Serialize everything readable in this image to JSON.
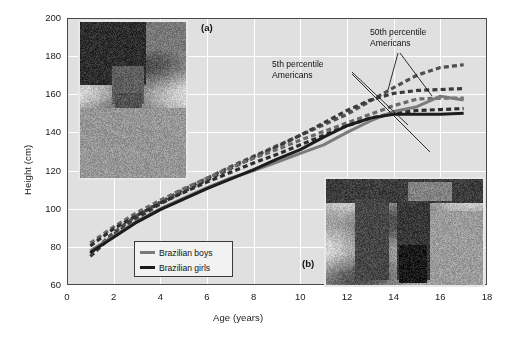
{
  "figure": {
    "panel_a_label": "(a)",
    "panel_b_label": "(b)"
  },
  "annotations": {
    "p5_line1": "5th percentile",
    "p5_line2": "Americans",
    "p50_line1": "50th percentile",
    "p50_line2": "Americans"
  },
  "legend": {
    "boys_label": "Brazilian boys",
    "girls_label": "Brazilian girls",
    "boys_color": "#7b7b7b",
    "girls_color": "#1c1c1c"
  },
  "photos": {
    "photo_a_name": "malnourished-child-photo",
    "photo_b_name": "girls-carrying-basin-photo"
  },
  "chart_data": {
    "type": "line",
    "title": "",
    "xlabel": "Age (years)",
    "ylabel": "Height (cm)",
    "xlim": [
      0,
      18
    ],
    "ylim": [
      60,
      200
    ],
    "xticks": [
      0,
      2,
      4,
      6,
      8,
      10,
      12,
      14,
      16,
      18
    ],
    "yticks": [
      60,
      80,
      100,
      120,
      140,
      160,
      180,
      200
    ],
    "grid": true,
    "legend_position": "lower-left-inside",
    "plot_bgcolor": "#e0e0e0",
    "grid_color": "#ffffff",
    "axis_color": "#4a4a4a",
    "x": [
      1,
      2,
      3,
      4,
      5,
      6,
      7,
      8,
      9,
      10,
      11,
      12,
      13,
      14,
      15,
      16,
      17
    ],
    "series": [
      {
        "name": "50th percentile Americans boys",
        "style": "dashed",
        "color": "#4f4f4f",
        "width": 3.2,
        "values": [
          76.5,
          87.5,
          96.5,
          103.5,
          110.0,
          116.0,
          122.0,
          127.5,
          133.0,
          138.5,
          144.0,
          149.5,
          156.5,
          163.5,
          170.0,
          174.0,
          175.5
        ]
      },
      {
        "name": "50th percentile Americans girls",
        "style": "dashed",
        "color": "#3b3b3b",
        "width": 3.2,
        "values": [
          75.0,
          86.5,
          95.0,
          102.5,
          109.0,
          115.0,
          121.0,
          127.0,
          132.5,
          138.5,
          145.0,
          151.5,
          157.0,
          160.5,
          162.0,
          162.5,
          163.0
        ]
      },
      {
        "name": "5th percentile Americans boys",
        "style": "dashed",
        "color": "#6a6a6a",
        "width": 3.2,
        "values": [
          82.0,
          90.5,
          98.0,
          104.5,
          110.5,
          116.0,
          121.5,
          126.5,
          131.0,
          136.0,
          140.5,
          145.0,
          149.5,
          154.0,
          157.5,
          158.0,
          158.0
        ]
      },
      {
        "name": "5th percentile Americans girls",
        "style": "dashed",
        "color": "#2e2e2e",
        "width": 3.2,
        "values": [
          80.5,
          89.5,
          96.5,
          103.0,
          108.5,
          114.0,
          119.0,
          124.0,
          128.5,
          133.5,
          138.5,
          143.5,
          147.5,
          150.0,
          151.5,
          152.0,
          152.5
        ]
      },
      {
        "name": "Brazilian boys",
        "style": "solid",
        "color": "#7b7b7b",
        "width": 3.0,
        "values": [
          78.0,
          85.5,
          93.5,
          100.0,
          105.5,
          111.0,
          116.0,
          120.0,
          124.5,
          129.0,
          133.5,
          140.0,
          146.0,
          151.0,
          153.5,
          159.0,
          157.0
        ]
      },
      {
        "name": "Brazilian girls",
        "style": "solid",
        "color": "#1c1c1c",
        "width": 3.0,
        "values": [
          77.0,
          85.0,
          93.0,
          99.5,
          105.0,
          110.5,
          115.5,
          120.5,
          126.0,
          131.0,
          137.5,
          143.5,
          147.5,
          149.5,
          149.5,
          149.5,
          150.0
        ]
      }
    ],
    "leaders": [
      {
        "from": [
          352,
          72
        ],
        "to": [
          408,
          125
        ],
        "name": "p5-leader-1"
      },
      {
        "from": [
          352,
          74
        ],
        "to": [
          430,
          152
        ],
        "name": "p5-leader-2"
      },
      {
        "from": [
          398,
          53
        ],
        "to": [
          388,
          90
        ],
        "name": "p50-leader-1"
      },
      {
        "from": [
          400,
          53
        ],
        "to": [
          432,
          96
        ],
        "name": "p50-leader-2"
      }
    ]
  }
}
